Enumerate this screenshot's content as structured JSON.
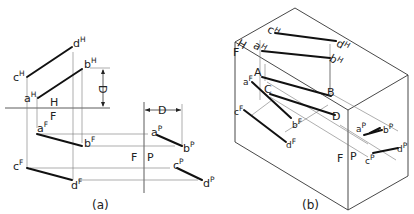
{
  "figure_a": {
    "caption": "(a)",
    "planes": {
      "H": "H",
      "F": "F",
      "F2": "F",
      "P": "P"
    },
    "dimension_label": "D",
    "points": {
      "cH": {
        "base": "c",
        "sup": "H"
      },
      "dH": {
        "base": "d",
        "sup": "H"
      },
      "aH": {
        "base": "a",
        "sup": "H"
      },
      "bH": {
        "base": "b",
        "sup": "H"
      },
      "aF": {
        "base": "a",
        "sup": "F"
      },
      "bF": {
        "base": "b",
        "sup": "F"
      },
      "cF": {
        "base": "c",
        "sup": "F"
      },
      "dF": {
        "base": "d",
        "sup": "F"
      },
      "aP": {
        "base": "a",
        "sup": "P"
      },
      "bP": {
        "base": "b",
        "sup": "P"
      },
      "cP": {
        "base": "c",
        "sup": "P"
      },
      "dP": {
        "base": "d",
        "sup": "P"
      }
    }
  },
  "figure_b": {
    "caption": "(b)",
    "planes": {
      "H": "H",
      "F": "F",
      "F2": "F",
      "P": "P"
    },
    "points": {
      "A": "A",
      "B": "B",
      "C": "C",
      "D": "D",
      "cH": {
        "base": "c",
        "sup": "H"
      },
      "dH": {
        "base": "d",
        "sup": "H"
      },
      "aH": {
        "base": "a",
        "sup": "H"
      },
      "bH": {
        "base": "b",
        "sup": "H"
      },
      "aF": {
        "base": "a",
        "sup": "F"
      },
      "bF": {
        "base": "b",
        "sup": "F"
      },
      "cF": {
        "base": "c",
        "sup": "F"
      },
      "dF": {
        "base": "d",
        "sup": "F"
      },
      "aP": {
        "base": "a",
        "sup": "P"
      },
      "bP": {
        "base": "b",
        "sup": "P"
      },
      "cP": {
        "base": "c",
        "sup": "P"
      },
      "dP": {
        "base": "d",
        "sup": "P"
      }
    }
  }
}
